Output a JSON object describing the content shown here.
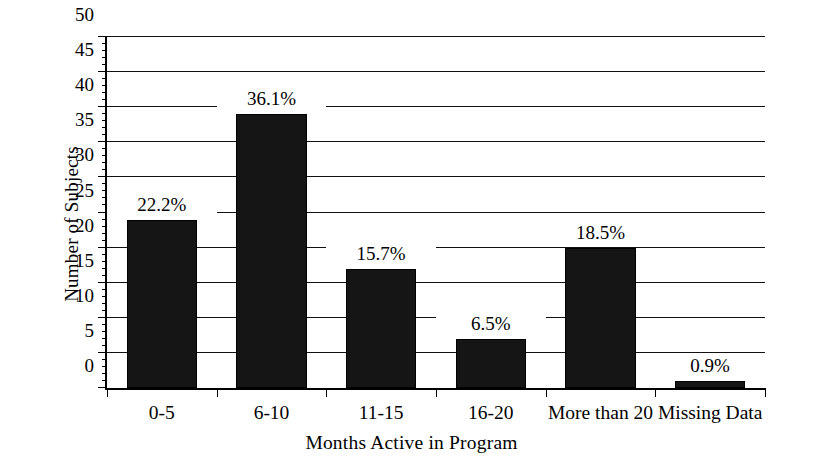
{
  "chart_data": {
    "type": "bar",
    "title": "",
    "xlabel": "Months Active in Program",
    "ylabel": "Number of Subjects",
    "categories": [
      "0-5",
      "6-10",
      "11-15",
      "16-20",
      "More than 20",
      "Missing Data"
    ],
    "values": [
      24,
      39,
      17,
      7,
      20,
      1
    ],
    "data_labels": [
      "22.2%",
      "36.1%",
      "15.7%",
      "6.5%",
      "18.5%",
      "0.9%"
    ],
    "ylim": [
      0,
      50
    ],
    "y_major_ticks": [
      0,
      5,
      10,
      15,
      20,
      25,
      30,
      35,
      40,
      45,
      50
    ],
    "y_tick_labels": [
      "0",
      "5",
      "10",
      "15",
      "20",
      "25",
      "30",
      "35",
      "40",
      "45",
      "50"
    ],
    "y_minor_tick_step": 1,
    "grid": "horizontal",
    "legend": "none",
    "bar_color": "#151515",
    "background_color": "#ffffff",
    "axis_color": "#000000"
  }
}
